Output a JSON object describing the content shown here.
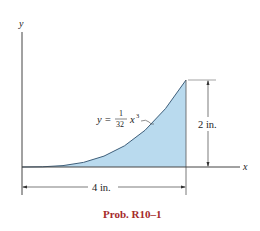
{
  "figure": {
    "axis_y_label": "y",
    "axis_x_label": "x",
    "equation": {
      "lhs": "y =",
      "numerator": "1",
      "denominator": "32",
      "variable": "x",
      "exponent": "3"
    },
    "height_dimension": "2 in.",
    "width_dimension": "4 in.",
    "caption": "Prob. R10–1"
  },
  "colors": {
    "fill": "#b9daee",
    "curve": "#3f5f7a",
    "lines": "#444444",
    "caption": "#a52a2a"
  }
}
